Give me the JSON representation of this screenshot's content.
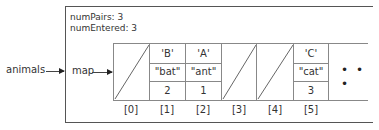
{
  "object": {
    "fields": [
      {
        "name": "numPairs",
        "value": "3",
        "text": "numPairs: 3"
      },
      {
        "name": "numEntered",
        "value": "3",
        "text": "numEntered: 3"
      }
    ]
  },
  "labels": {
    "variable": "animals",
    "map_field": "map"
  },
  "array": {
    "cells": [
      {
        "index": "[0]",
        "null": true
      },
      {
        "index": "[1]",
        "null": false,
        "key": "'B'",
        "value": "\"bat\"",
        "count": "2"
      },
      {
        "index": "[2]",
        "null": false,
        "key": "'A'",
        "value": "\"ant\"",
        "count": "1"
      },
      {
        "index": "[3]",
        "null": true
      },
      {
        "index": "[4]",
        "null": true
      },
      {
        "index": "[5]",
        "null": false,
        "key": "'C'",
        "value": "\"cat\"",
        "count": "3"
      }
    ],
    "continuation": "• • •"
  }
}
